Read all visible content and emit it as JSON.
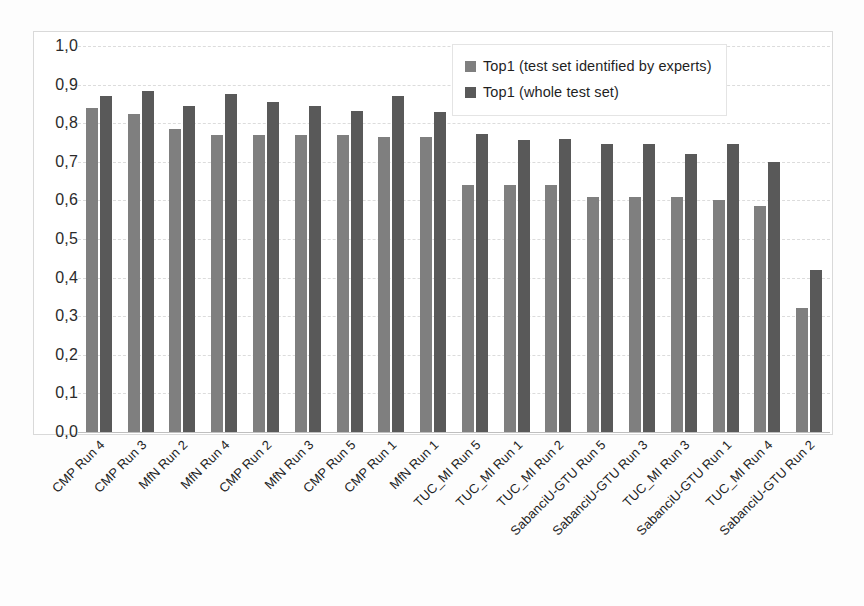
{
  "chart_data": {
    "type": "bar",
    "title": "",
    "xlabel": "",
    "ylabel": "",
    "ylim": [
      0.0,
      1.0
    ],
    "ytick_labels": [
      "1,0",
      "0,9",
      "0,8",
      "0,7",
      "0,6",
      "0,5",
      "0,4",
      "0,3",
      "0,2",
      "0,1",
      "0,0"
    ],
    "ytick_values": [
      1.0,
      0.9,
      0.8,
      0.7,
      0.6,
      0.5,
      0.4,
      0.3,
      0.2,
      0.1,
      0.0
    ],
    "grid": true,
    "legend_position": "top-right",
    "categories": [
      "CMP Run 4",
      "CMP Run 3",
      "MfN Run 2",
      "MfN Run 4",
      "CMP Run 2",
      "MfN Run 3",
      "CMP Run 5",
      "CMP Run 1",
      "MfN Run 1",
      "TUC_MI Run 5",
      "TUC_MI Run 1",
      "TUC_MI Run 2",
      "SabanciU-GTU Run 5",
      "SabanciU-GTU Run 3",
      "TUC_MI Run 3",
      "SabanciU-GTU Run 1",
      "TUC_MI Run 4",
      "SabanciU-GTU Run 2"
    ],
    "series": [
      {
        "name": "Top1 (test set identified by experts)",
        "color": "#7f7f7f",
        "values": [
          0.84,
          0.825,
          0.785,
          0.77,
          0.77,
          0.77,
          0.77,
          0.765,
          0.765,
          0.64,
          0.64,
          0.64,
          0.61,
          0.61,
          0.61,
          0.6,
          0.585,
          0.32
        ]
      },
      {
        "name": "Top1 (whole test set)",
        "color": "#595959",
        "values": [
          0.87,
          0.883,
          0.845,
          0.875,
          0.855,
          0.845,
          0.832,
          0.87,
          0.83,
          0.773,
          0.757,
          0.758,
          0.745,
          0.745,
          0.72,
          0.745,
          0.7,
          0.42
        ]
      }
    ]
  },
  "legend": {
    "items": [
      {
        "label": "Top1 (test set identified by experts)",
        "color": "#7f7f7f"
      },
      {
        "label": "Top1 (whole test set)",
        "color": "#595959"
      }
    ]
  }
}
